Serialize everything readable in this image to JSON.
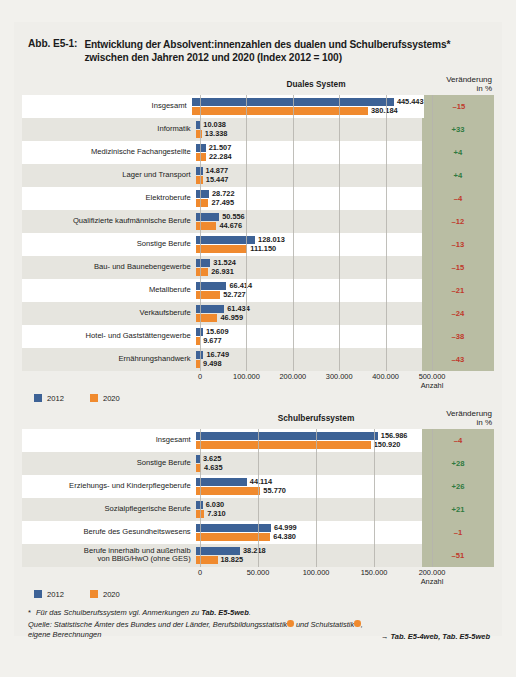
{
  "figure": {
    "tag": "Abb. E5-1:",
    "title_line1": "Entwicklung der Absolvent:innenzahlen des dualen und Schulberufssystems*",
    "title_line2": "zwischen den Jahren 2012 und 2020 (Index 2012 = 100)"
  },
  "legend": {
    "series_2012": "2012",
    "series_2020": "2020",
    "color_2012": "#3d6296",
    "color_2020": "#f08a2e"
  },
  "columns": {
    "change_header_line1": "Veränderung",
    "change_header_line2": "in %",
    "axis_unit": "Anzahl"
  },
  "footnotes": {
    "star_marker": "*",
    "star_text_a": "Für das Schulberufssystem vgl. Anmerkungen zu ",
    "star_text_b": "Tab. E5-5web",
    "star_text_c": ".",
    "source_a": "Quelle: Statistische Ämter des Bundes und der Länder, Berufsbildungsstatistik",
    "source_b": " und Schulstatistik",
    "source_c": ",",
    "source_d": "eigene Berechnungen",
    "tab_ref": "Tab. E5-4web, Tab. E5-5web",
    "arrow": "→"
  },
  "chart_data": [
    {
      "type": "bar",
      "orientation": "horizontal",
      "title": "Duales System",
      "xlabel": "Anzahl",
      "ylabel": "",
      "xlim": [
        0,
        500000
      ],
      "xticks": [
        0,
        100000,
        200000,
        300000,
        400000,
        500000
      ],
      "xticklabels": [
        "0",
        "100.000",
        "200.000",
        "300.000",
        "400.000",
        "500.000"
      ],
      "grid": true,
      "legend_position": "bottom-left",
      "categories": [
        "Insgesamt",
        "Informatik",
        "Medizinische Fachangestellte",
        "Lager und Transport",
        "Elektroberufe",
        "Qualifizierte kaufmännische Berufe",
        "Sonstige Berufe",
        "Bau- und Baunebengewerbe",
        "Metallberufe",
        "Verkaufsberufe",
        "Hotel- und Gaststättengewerbe",
        "Ernährungshandwerk"
      ],
      "series": [
        {
          "name": "2012",
          "values": [
            445443,
            10038,
            21507,
            14877,
            28722,
            50556,
            128013,
            31524,
            66414,
            61434,
            15609,
            16749
          ],
          "labels": [
            "445.443",
            "10.038",
            "21.507",
            "14.877",
            "28.722",
            "50.556",
            "128.013",
            "31.524",
            "66.414",
            "61.434",
            "15.609",
            "16.749"
          ]
        },
        {
          "name": "2020",
          "values": [
            380184,
            13338,
            22284,
            15447,
            27495,
            44676,
            111150,
            26931,
            52727,
            46959,
            9677,
            9498
          ],
          "labels": [
            "380.184",
            "13.338",
            "22.284",
            "15.447",
            "27.495",
            "44.676",
            "111.150",
            "26.931",
            "52.727",
            "46.959",
            "9.677",
            "9.498"
          ]
        }
      ],
      "change_pct": [
        "-15",
        "+33",
        "+4",
        "+4",
        "-4",
        "-12",
        "-13",
        "-15",
        "-21",
        "-24",
        "-38",
        "-43"
      ]
    },
    {
      "type": "bar",
      "orientation": "horizontal",
      "title": "Schulberufssystem",
      "xlabel": "Anzahl",
      "ylabel": "",
      "xlim": [
        0,
        200000
      ],
      "xticks": [
        0,
        50000,
        100000,
        150000,
        200000
      ],
      "xticklabels": [
        "0",
        "50.000",
        "100.000",
        "150.000",
        "200.000"
      ],
      "grid": true,
      "legend_position": "bottom-left",
      "categories": [
        "Insgesamt",
        "Sonstige Berufe",
        "Erziehungs- und Kinderpflegeberufe",
        "Sozialpflegerische Berufe",
        "Berufe des Gesundheitswesens",
        "Berufe innerhalb und außerhalb|von BBiG/HwO (ohne GES)"
      ],
      "series": [
        {
          "name": "2012",
          "values": [
            156986,
            3625,
            44114,
            6030,
            64999,
            38218
          ],
          "labels": [
            "156.986",
            "3.625",
            "44.114",
            "6.030",
            "64.999",
            "38.218"
          ]
        },
        {
          "name": "2020",
          "values": [
            150920,
            4635,
            55770,
            7310,
            64380,
            18825
          ],
          "labels": [
            "150.920",
            "4.635",
            "55.770",
            "7.310",
            "64.380",
            "18.825"
          ]
        }
      ],
      "change_pct": [
        "-4",
        "+28",
        "+26",
        "+21",
        "-1",
        "-51"
      ]
    }
  ]
}
